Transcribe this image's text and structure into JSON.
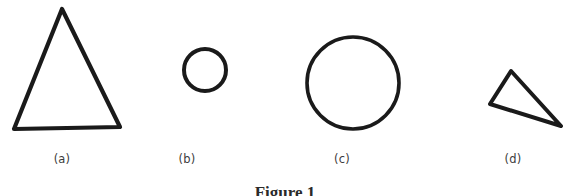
{
  "figure": {
    "caption": "Figure 1",
    "background_color": "#ffffff",
    "ink_color": "#1a1a1a",
    "label_color": "#3c3c3c",
    "width": 570,
    "height": 196
  },
  "panels": [
    {
      "id": "a",
      "label": "(a)",
      "shape": "triangle",
      "description": "large upright isosceles triangle",
      "label_x": 62,
      "label_y": 152,
      "stroke_width": 4.2,
      "points": "62,9 120,127 14,129"
    },
    {
      "id": "b",
      "label": "(b)",
      "shape": "circle",
      "description": "small circle",
      "label_x": 187,
      "label_y": 152,
      "stroke_width": 4.0,
      "cx": 205,
      "cy": 70,
      "r": 21
    },
    {
      "id": "c",
      "label": "(c)",
      "shape": "circle",
      "description": "large circle",
      "label_x": 342,
      "label_y": 152,
      "stroke_width": 3.6,
      "cx": 353,
      "cy": 83,
      "r": 46
    },
    {
      "id": "d",
      "label": "(d)",
      "shape": "triangle",
      "description": "small tilted scalene triangle",
      "label_x": 513,
      "label_y": 152,
      "stroke_width": 4.0,
      "points": "511,71 561,126 490,104"
    }
  ]
}
